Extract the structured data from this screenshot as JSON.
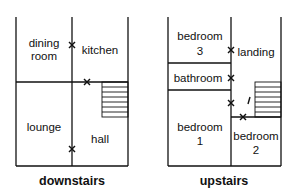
{
  "downstairs": {
    "caption": "downstairs",
    "rooms": [
      {
        "name": "dining",
        "line2": "room"
      },
      {
        "name": "kitchen"
      },
      {
        "name": "lounge"
      },
      {
        "name": "hall"
      }
    ]
  },
  "upstairs": {
    "caption": "upstairs",
    "rooms": [
      {
        "name": "bedroom",
        "line2": "3"
      },
      {
        "name": "landing"
      },
      {
        "name": "bathroom"
      },
      {
        "name": "bedroom",
        "line2": "1"
      },
      {
        "name": "bedroom",
        "line2": "2"
      }
    ],
    "annotation": "/"
  },
  "icons": {
    "door_marker": "x-mark",
    "stairs": "stairs-hatch"
  }
}
